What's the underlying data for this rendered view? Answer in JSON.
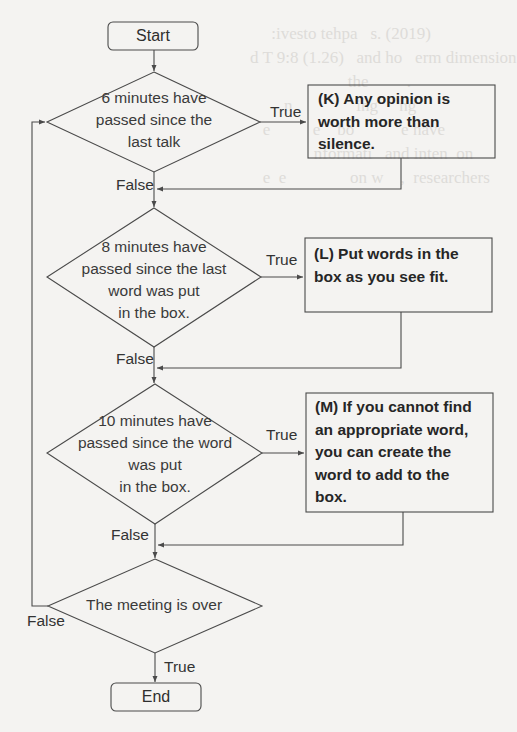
{
  "flowchart": {
    "start": "Start",
    "end": "End",
    "decisions": [
      {
        "id": "d1",
        "text": "6 minutes have passed since the last talk",
        "lines": [
          "6 minutes have",
          "passed since the",
          "last talk"
        ]
      },
      {
        "id": "d2",
        "text": "8 minutes have passed since the last word was put in the box.",
        "lines": [
          "8 minutes have",
          "passed since the last",
          "word was put",
          "in the box."
        ]
      },
      {
        "id": "d3",
        "text": "10 minutes have passed since the word was put in the box.",
        "lines": [
          "10 minutes have",
          "passed since the word",
          "was put",
          "in the box."
        ]
      },
      {
        "id": "d4",
        "text": "The meeting is over",
        "lines": [
          "The meeting is over"
        ]
      }
    ],
    "actions": [
      {
        "id": "K",
        "lines": [
          "(K) Any opinion is",
          "worth more than",
          "silence."
        ]
      },
      {
        "id": "L",
        "lines": [
          "(L) Put words in the",
          "box as you see fit."
        ]
      },
      {
        "id": "M",
        "lines": [
          "(M) If you cannot find",
          "an appropriate word,",
          "you can create the",
          "word to add to the",
          "box."
        ]
      }
    ],
    "edge_labels": {
      "d1_true": "True",
      "d1_false": "False",
      "d2_true": "True",
      "d2_false": "False",
      "d3_true": "True",
      "d3_false": "False",
      "d4_true": "True",
      "d4_false": "False"
    }
  },
  "colors": {
    "line": "#4a4a4a",
    "background": "#f4f3f1"
  }
}
